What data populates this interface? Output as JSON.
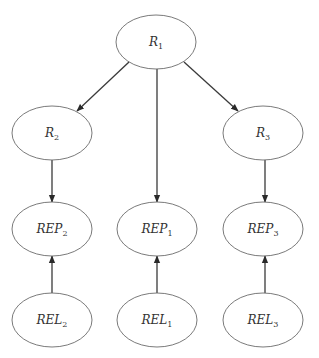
{
  "diagram": {
    "type": "directed-graph",
    "colors": {
      "stroke": "#6b6b6b",
      "edge": "#3a3a3a",
      "text": "#333333",
      "background": "#ffffff"
    },
    "nodes": [
      {
        "id": "R1",
        "base": "R",
        "sub": "1",
        "cx": 156,
        "cy": 42,
        "rx": 40,
        "ry": 27
      },
      {
        "id": "R2",
        "base": "R",
        "sub": "2",
        "cx": 52,
        "cy": 133,
        "rx": 40,
        "ry": 27
      },
      {
        "id": "R3",
        "base": "R",
        "sub": "3",
        "cx": 263,
        "cy": 133,
        "rx": 40,
        "ry": 27
      },
      {
        "id": "REP2",
        "base": "REP",
        "sub": "2",
        "cx": 52,
        "cy": 229,
        "rx": 40,
        "ry": 27
      },
      {
        "id": "REP1",
        "base": "REP",
        "sub": "1",
        "cx": 157,
        "cy": 229,
        "rx": 40,
        "ry": 27
      },
      {
        "id": "REP3",
        "base": "REP",
        "sub": "3",
        "cx": 263,
        "cy": 229,
        "rx": 40,
        "ry": 27
      },
      {
        "id": "REL2",
        "base": "REL",
        "sub": "2",
        "cx": 52,
        "cy": 320,
        "rx": 40,
        "ry": 27
      },
      {
        "id": "REL1",
        "base": "REL",
        "sub": "1",
        "cx": 157,
        "cy": 320,
        "rx": 40,
        "ry": 27
      },
      {
        "id": "REL3",
        "base": "REL",
        "sub": "3",
        "cx": 263,
        "cy": 320,
        "rx": 40,
        "ry": 27
      }
    ],
    "edges": [
      {
        "from": "R1",
        "to": "R2",
        "x1": 129,
        "y1": 62,
        "x2": 77,
        "y2": 111
      },
      {
        "from": "R1",
        "to": "REP1",
        "x1": 157,
        "y1": 69,
        "x2": 157,
        "y2": 202
      },
      {
        "from": "R1",
        "to": "R3",
        "x1": 184,
        "y1": 62,
        "x2": 238,
        "y2": 111
      },
      {
        "from": "R2",
        "to": "REP2",
        "x1": 52,
        "y1": 160,
        "x2": 52,
        "y2": 202
      },
      {
        "from": "R3",
        "to": "REP3",
        "x1": 265,
        "y1": 160,
        "x2": 265,
        "y2": 202
      },
      {
        "from": "REL2",
        "to": "REP2",
        "x1": 52,
        "y1": 293,
        "x2": 52,
        "y2": 256
      },
      {
        "from": "REL1",
        "to": "REP1",
        "x1": 157,
        "y1": 293,
        "x2": 157,
        "y2": 256
      },
      {
        "from": "REL3",
        "to": "REP3",
        "x1": 265,
        "y1": 293,
        "x2": 265,
        "y2": 256
      }
    ]
  }
}
